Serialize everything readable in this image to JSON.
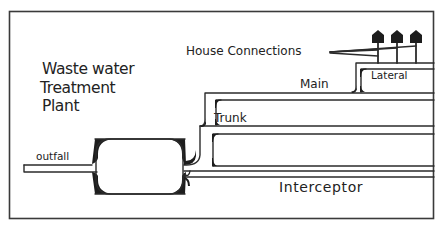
{
  "diagram": {
    "title_lines": [
      "Waste water",
      "Treatment",
      "Plant"
    ],
    "labels": {
      "house_connections": "House Connections",
      "lateral": "Lateral",
      "main": "Main",
      "trunk": "Trunk",
      "outfall": "outfall",
      "interceptor": "Interceptor"
    },
    "icons": [
      "house-icon",
      "house-icon",
      "house-icon"
    ],
    "colors": {
      "line": "#2b2b2b",
      "fill": "#1d1d1d",
      "background": "#ffffff"
    },
    "hierarchy": [
      "House Connections",
      "Lateral",
      "Main",
      "Trunk",
      "Interceptor",
      "Waste water Treatment Plant",
      "outfall"
    ]
  }
}
